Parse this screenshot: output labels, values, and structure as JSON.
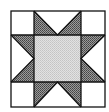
{
  "figure": {
    "colors": {
      "background": "#ffffff",
      "outline": "#111111",
      "star_points": "#7a7a7a",
      "center": "#d4d4d4",
      "corner": "#ffffff"
    },
    "geometry": {
      "outer": {
        "x0": 11,
        "y0": 11,
        "x1": 105,
        "y1": 107
      },
      "grid_x": [
        11,
        34,
        81,
        105
      ],
      "grid_y": [
        11,
        35,
        82,
        107
      ]
    }
  }
}
